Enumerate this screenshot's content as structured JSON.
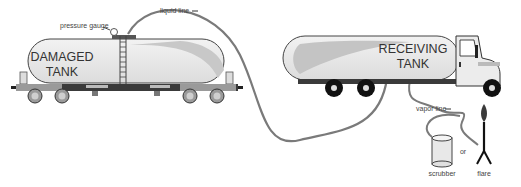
{
  "diagram": {
    "type": "process-illustration",
    "labels": {
      "pressure_gauge": "pressure gauge",
      "liquid_line": "liquid line",
      "vapor_line": "vapor line",
      "damaged_tank_line1": "DAMAGED",
      "damaged_tank_line2": "TANK",
      "receiving_tank_line1": "RECEIVING",
      "receiving_tank_line2": "TANK",
      "scrubber": "scrubber",
      "or": "or",
      "flare": "flare"
    },
    "components": [
      {
        "id": "damaged-tank",
        "kind": "rail tank car"
      },
      {
        "id": "receiving-tank",
        "kind": "tanker truck"
      },
      {
        "id": "pressure-gauge",
        "kind": "gauge",
        "on": "damaged-tank"
      },
      {
        "id": "liquid-line",
        "kind": "hose",
        "from": "damaged-tank",
        "to": "receiving-tank",
        "direction": "right"
      },
      {
        "id": "vapor-line",
        "kind": "hose",
        "from": "receiving-tank",
        "to": "scrubber-or-flare",
        "direction": "right"
      },
      {
        "id": "scrubber",
        "kind": "canister"
      },
      {
        "id": "flare",
        "kind": "flare stack"
      }
    ],
    "colors": {
      "tank_fill": "#e6e6e6",
      "tank_shade": "#c4c4c4",
      "outline": "#333333",
      "chassis": "#3a3a3a",
      "hose": "#7a7a7a",
      "wheel_truck": "#111111",
      "wheel_rail": "#888888"
    }
  }
}
